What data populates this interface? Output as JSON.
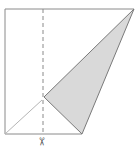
{
  "diagram": {
    "type": "paper-fold-cut",
    "colors": {
      "outline": "#8a8a8a",
      "fold_fill": "#d9d9d9",
      "dashed": "#8a8a8a",
      "fold_line": "#b5b5b5"
    },
    "shapes": {
      "paper_outline": "5,9 134,9 82,134 5,134",
      "folded_triangle": "134,9 44,97 82,134",
      "crease_line": {
        "x1": 5,
        "y1": 134,
        "x2": 42,
        "y2": 100
      },
      "cut_line": {
        "x1": 43,
        "y1": 9,
        "x2": 43,
        "y2": 134
      }
    },
    "scissors_icon": "✂"
  }
}
